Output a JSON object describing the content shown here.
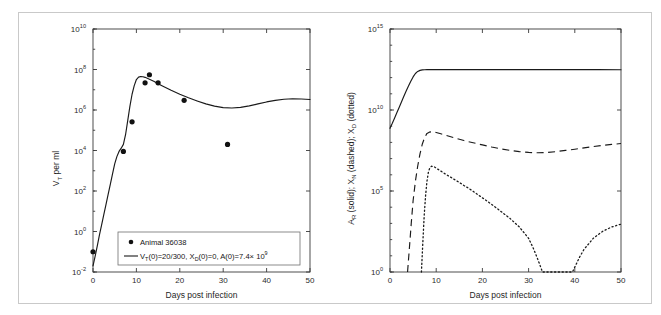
{
  "figure": {
    "title": "",
    "border_color": "#c9c9c9",
    "background": "#ffffff"
  },
  "chart_data": [
    {
      "id": "left-panel",
      "type": "line",
      "title": "",
      "xlabel": "Days post infection",
      "ylabel": "V_T per ml",
      "ylabel_parts": {
        "base": "V",
        "sub": "T",
        "rest": " per ml"
      },
      "xlim": [
        0,
        50
      ],
      "ylim": [
        0.01,
        10000000000.0
      ],
      "yscale": "log",
      "grid": false,
      "xticks": [
        0,
        10,
        20,
        30,
        40,
        50
      ],
      "xticklabels": [
        "0",
        "10",
        "20",
        "30",
        "40",
        "50"
      ],
      "yticks": [
        0.01,
        1,
        100,
        10000,
        1000000,
        100000000,
        10000000000
      ],
      "yticklabels": [
        "10-2",
        "100",
        "102",
        "104",
        "106",
        "108",
        "1010"
      ],
      "yticklabels_mantissa": "10",
      "yticklabels_exponents": [
        "-2",
        "0",
        "2",
        "4",
        "6",
        "8",
        "10"
      ],
      "series": [
        {
          "name": "model-fit",
          "style": "solid",
          "label": "VT(0)=20/300, XD(0)=0, A(0)=7.4 x 10^9",
          "x": [
            0,
            0.5,
            1,
            1.5,
            2,
            2.5,
            3,
            3.5,
            4,
            4.5,
            5,
            5.5,
            6,
            6.5,
            7,
            7.5,
            8,
            8.5,
            9,
            9.5,
            10,
            10.5,
            11,
            11.5,
            12,
            13,
            14,
            15,
            16,
            18,
            20,
            22,
            24,
            26,
            28,
            30,
            32,
            34,
            36,
            38,
            40,
            42,
            44,
            46,
            48,
            50
          ],
          "y": [
            0.02,
            0.06,
            0.2,
            0.7,
            2.2,
            7,
            22,
            70,
            220,
            700,
            2200,
            5000,
            9000,
            13000,
            20000,
            60000,
            300000,
            1500000,
            6000000,
            16000000.0,
            32000000.0,
            42000000.0,
            45000000.0,
            44000000.0,
            41000000.0,
            33000000.0,
            26000000.0,
            20000000.0,
            15500000.0,
            9500000.0,
            6000000.0,
            4000000.0,
            2800000.0,
            2000000.0,
            1550000.0,
            1300000.0,
            1250000.0,
            1350000.0,
            1600000.0,
            2000000.0,
            2500000.0,
            3000000.0,
            3400000.0,
            3600000.0,
            3500000.0,
            3300000.0
          ]
        },
        {
          "name": "observed-data",
          "style": "markers",
          "label": "Animal 36038",
          "x": [
            0,
            7,
            9,
            12,
            13,
            15,
            21,
            31
          ],
          "y": [
            0.1,
            9000,
            260000,
            22000000.0,
            55000000.0,
            22000000.0,
            3000000.0,
            20000.0
          ]
        }
      ],
      "legend": {
        "position": "lower-center",
        "entries": [
          {
            "marker": "dot",
            "label": "Animal 36038"
          },
          {
            "marker": "line",
            "label_parts": {
              "v": "V",
              "v_sub": "T",
              "t1": "(0)=20/300, ",
              "x": "X",
              "x_sub": "D",
              "t2": "(0)=0, A(0)=7.4",
              "times": "×",
              "ten": " 10",
              "exp": "9"
            }
          }
        ]
      }
    },
    {
      "id": "right-panel",
      "type": "line",
      "title": "",
      "xlabel": "Days post infection",
      "ylabel": "A_R (solid); X_N (dashed); X_D (dotted)",
      "ylabel_parts": {
        "a": "A",
        "a_sub": "R",
        "t1": " (solid); ",
        "xn": "X",
        "xn_sub": "N",
        "t2": " (dashed); ",
        "xd": "X",
        "xd_sub": "D",
        "t3": " (dotted)"
      },
      "xlim": [
        0,
        50
      ],
      "ylim": [
        1,
        1000000000000000.0
      ],
      "yscale": "log",
      "grid": false,
      "xticks": [
        0,
        10,
        20,
        30,
        40,
        50
      ],
      "xticklabels": [
        "0",
        "10",
        "20",
        "30",
        "40",
        "50"
      ],
      "yticks": [
        1,
        100000,
        10000000000,
        1000000000000000
      ],
      "yticklabels_mantissa": "10",
      "yticklabels_exponents": [
        "0",
        "5",
        "10",
        "15"
      ],
      "series": [
        {
          "name": "A_R",
          "style": "solid",
          "legend_label": "A_R (solid)",
          "x": [
            0,
            0.5,
            1,
            1.5,
            2,
            2.5,
            3,
            3.5,
            4,
            4.5,
            5,
            5.5,
            6,
            6.5,
            7,
            7.5,
            8,
            9,
            10,
            15,
            20,
            25,
            30,
            35,
            40,
            45,
            50
          ],
          "y": [
            740000000.0,
            1500000000.0,
            3200000000.0,
            7000000000.0,
            15000000000.0,
            32000000000.0,
            70000000000.0,
            150000000000.0,
            300000000000.0,
            600000000000.0,
            1100000000000.0,
            1800000000000.0,
            2400000000000.0,
            2800000000000.0,
            3000000000000.0,
            3050000000000.0,
            3100000000000.0,
            3100000000000.0,
            3100000000000.0,
            3100000000000.0,
            3100000000000.0,
            3100000000000.0,
            3100000000000.0,
            3100000000000.0,
            3100000000000.0,
            3100000000000.0,
            3050000000000.0
          ]
        },
        {
          "name": "X_N",
          "style": "dashed",
          "legend_label": "X_N (dashed)",
          "x": [
            3.8,
            4.2,
            4.6,
            5,
            5.5,
            6,
            6.5,
            7,
            7.5,
            8,
            8.5,
            9,
            10,
            11,
            12,
            14,
            16,
            18,
            20,
            22,
            24,
            26,
            28,
            30,
            32,
            34,
            36,
            38,
            40,
            42,
            44,
            46,
            48,
            50
          ],
          "y": [
            1,
            30,
            1000,
            25000.0,
            400000.0,
            3500000.0,
            20000000.0,
            80000000.0,
            200000000.0,
            360000000.0,
            430000000.0,
            450000000.0,
            410000000.0,
            340000000.0,
            280000000.0,
            190000000.0,
            130000000.0,
            95000000.0,
            70000000.0,
            52000000.0,
            40000000.0,
            32000000.0,
            27000000.0,
            24000000.0,
            23000000.0,
            24000000.0,
            27000000.0,
            32000000.0,
            38000000.0,
            46000000.0,
            55000000.0,
            65000000.0,
            75000000.0,
            85000000.0
          ]
        },
        {
          "name": "X_D",
          "style": "dotted",
          "legend_label": "X_D (dotted)",
          "x": [
            6.8,
            7.1,
            7.4,
            7.7,
            8,
            8.3,
            8.6,
            9,
            9.5,
            10,
            10.5,
            11,
            12,
            13,
            14,
            15,
            16,
            17,
            18,
            19,
            20,
            22,
            24,
            26,
            28,
            30,
            31,
            32,
            33,
            36,
            38,
            39.5,
            40,
            41,
            42,
            44,
            46,
            48,
            50
          ],
          "y": [
            1,
            60,
            3000,
            50000.0,
            400000.0,
            1400000.0,
            2600000.0,
            3400000.0,
            3200000.0,
            2600000.0,
            2100000.0,
            1700000.0,
            1100000.0,
            750000.0,
            500000.0,
            340000.0,
            220000.0,
            150000.0,
            95000.0,
            60000.0,
            38000.0,
            15000.0,
            5500,
            2000,
            600,
            120,
            30,
            6,
            1,
            1,
            1,
            1,
            2,
            8,
            25,
            120,
            320,
            600,
            900
          ]
        }
      ]
    }
  ]
}
